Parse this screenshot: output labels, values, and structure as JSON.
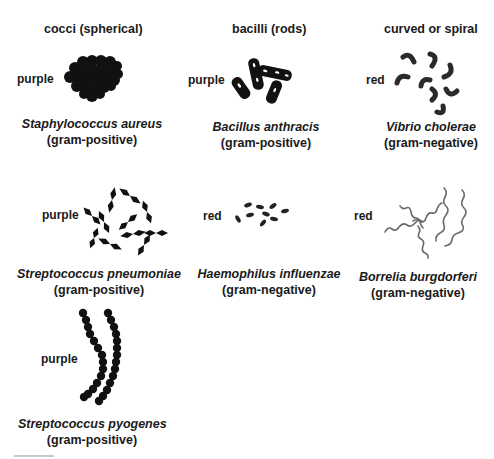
{
  "headers": {
    "cocci": "cocci (spherical)",
    "bacilli": "bacilli (rods)",
    "spiral": "curved or spiral"
  },
  "organisms": [
    {
      "id": "staphylococcus-aureus",
      "name": "Staphylococcus aureus",
      "gram": "(gram-positive)",
      "stain": "purple",
      "shape_icon": "grape-cluster-cocci-icon"
    },
    {
      "id": "bacillus-anthracis",
      "name": "Bacillus anthracis",
      "gram": "(gram-positive)",
      "stain": "purple",
      "shape_icon": "rod-bacilli-icon"
    },
    {
      "id": "vibrio-cholerae",
      "name": "Vibrio cholerae",
      "gram": "(gram-negative)",
      "stain": "red",
      "shape_icon": "curved-rod-icon"
    },
    {
      "id": "streptococcus-pneumoniae",
      "name": "Streptococcus pneumoniae",
      "gram": "(gram-positive)",
      "stain": "purple",
      "shape_icon": "lancet-diplococci-icon"
    },
    {
      "id": "haemophilus-influenzae",
      "name": "Haemophilus influenzae",
      "gram": "(gram-negative)",
      "stain": "red",
      "shape_icon": "coccobacilli-icon"
    },
    {
      "id": "borrelia-burgdorferi",
      "name": "Borrelia burgdorferi",
      "gram": "(gram-negative)",
      "stain": "red",
      "shape_icon": "spirochete-icon"
    },
    {
      "id": "streptococcus-pyogenes",
      "name": "Streptococcus pyogenes",
      "gram": "(gram-positive)",
      "stain": "purple",
      "shape_icon": "chain-cocci-icon"
    }
  ],
  "colors": {
    "ink": "#111111",
    "spirochete": "#6a6a6a",
    "text": "#1a1a1a"
  }
}
